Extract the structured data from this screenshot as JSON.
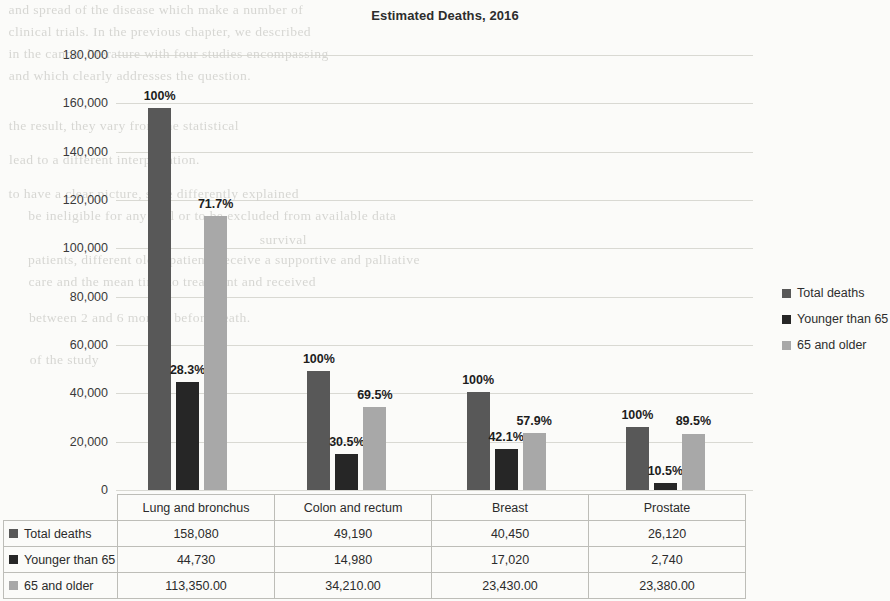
{
  "chart_data": {
    "type": "bar",
    "title": "Estimated Deaths, 2016",
    "xlabel": "",
    "ylabel": "",
    "ylim": [
      0,
      180000
    ],
    "ytick_values": [
      0,
      20000,
      40000,
      60000,
      80000,
      100000,
      120000,
      140000,
      160000,
      180000
    ],
    "ytick_labels": [
      "0",
      "20,000",
      "40,000",
      "60,000",
      "80,000",
      "100,000",
      "120,000",
      "140,000",
      "160,000",
      "180,000"
    ],
    "grid": true,
    "legend_position": "right",
    "categories": [
      "Lung and bronchus",
      "Colon and rectum",
      "Breast",
      "Prostate"
    ],
    "series": [
      {
        "name": "Total deaths",
        "color": "#585858",
        "values": [
          158080,
          49190,
          40450,
          26120
        ],
        "labels": [
          "158,080",
          "49,190",
          "40,450",
          "26,120"
        ],
        "point_labels": [
          "100%",
          "100%",
          "100%",
          "100%"
        ]
      },
      {
        "name": "Younger than 65",
        "color": "#262626",
        "values": [
          44730,
          14980,
          17020,
          2740
        ],
        "labels": [
          "44,730",
          "14,980",
          "17,020",
          "2,740"
        ],
        "point_labels": [
          "28.3%",
          "30.5%",
          "42.1%",
          "10.5%"
        ]
      },
      {
        "name": "65 and older",
        "color": "#a8a8a8",
        "values": [
          113350,
          34210,
          23430,
          23380
        ],
        "labels": [
          "113,350.00",
          "34,210.00",
          "23,430.00",
          "23,380.00"
        ],
        "point_labels": [
          "71.7%",
          "69.5%",
          "57.9%",
          "89.5%"
        ]
      }
    ]
  },
  "table": {
    "corner": "",
    "column_headers": [
      "Lung and bronchus",
      "Colon and rectum",
      "Breast",
      "Prostate"
    ],
    "rows": [
      {
        "label": "Total deaths",
        "swatch": "#585858",
        "cells": [
          "158,080",
          "49,190",
          "40,450",
          "26,120"
        ]
      },
      {
        "label": "Younger than 65",
        "swatch": "#262626",
        "cells": [
          "44,730",
          "14,980",
          "17,020",
          "2,740"
        ]
      },
      {
        "label": "65 and older",
        "swatch": "#a8a8a8",
        "cells": [
          "113,350.00",
          "34,210.00",
          "23,430.00",
          "23,380.00"
        ]
      }
    ]
  },
  "legend": {
    "items": [
      {
        "label": "Total deaths",
        "color": "#585858"
      },
      {
        "label": "Younger than 65",
        "color": "#262626"
      },
      {
        "label": "65 and older",
        "color": "#a8a8a8"
      }
    ]
  },
  "background_bleed": [
    {
      "text": "and spread of the disease which make a number of",
      "x": 10,
      "y": 2
    },
    {
      "text": "clinical trials. In the previous chapter, we described",
      "x": 10,
      "y": 24
    },
    {
      "text": "in the cancer literature with four studies encompassing",
      "x": 10,
      "y": 46
    },
    {
      "text": "and which clearly addresses the question.",
      "x": 10,
      "y": 68
    },
    {
      "text": "the result, they vary from the statistical",
      "x": 10,
      "y": 118
    },
    {
      "text": "lead to a different interpretation.",
      "x": 10,
      "y": 152
    },
    {
      "text": "to have a clear picture, state differently explained",
      "x": 10,
      "y": 186
    },
    {
      "text": "be ineligible for any trial or to be excluded from available data",
      "x": 30,
      "y": 208
    },
    {
      "text": "patients, different older patients receive a supportive and palliative",
      "x": 30,
      "y": 252
    },
    {
      "text": "care and the mean time to treatment and received",
      "x": 30,
      "y": 274
    },
    {
      "text": "between 2 and 6 months before death.",
      "x": 30,
      "y": 310
    },
    {
      "text": "of the study",
      "x": 30,
      "y": 352
    },
    {
      "text": "survival",
      "x": 260,
      "y": 232
    }
  ]
}
